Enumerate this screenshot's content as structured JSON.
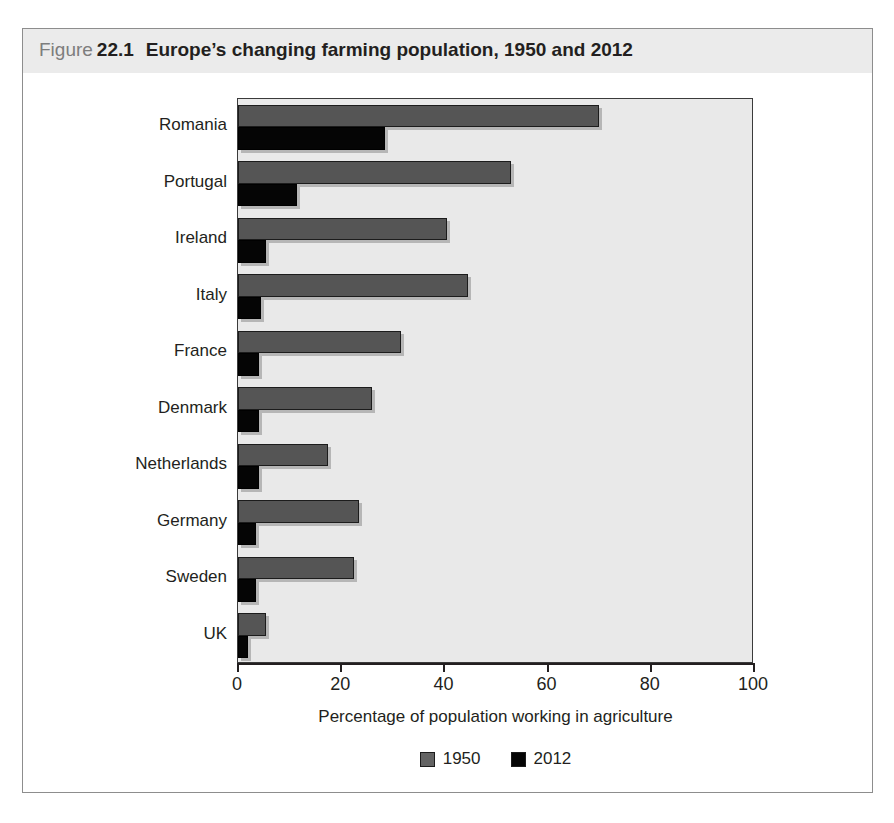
{
  "figure": {
    "label_word": "Figure",
    "number": "22.1",
    "title": "Europe’s changing farming population, 1950 and 2012"
  },
  "chart_data": {
    "type": "bar",
    "orientation": "horizontal",
    "title": "Europe’s changing farming population, 1950 and 2012",
    "xlabel": "Percentage of population working in agriculture",
    "ylabel": "",
    "xlim": [
      0,
      100
    ],
    "xticks": [
      0,
      20,
      40,
      60,
      80,
      100
    ],
    "xtick_labels": [
      "0",
      "20",
      "40",
      "60",
      "80",
      "100"
    ],
    "grid": false,
    "legend_position": "bottom-center",
    "categories": [
      "Romania",
      "Portugal",
      "Ireland",
      "Italy",
      "France",
      "Denmark",
      "Netherlands",
      "Germany",
      "Sweden",
      "UK"
    ],
    "series": [
      {
        "name": "1950",
        "color": "#555555",
        "values": [
          70,
          53,
          40.5,
          44.5,
          31.5,
          26,
          17.5,
          23.5,
          22.5,
          5.5
        ]
      },
      {
        "name": "2012",
        "color": "#050505",
        "values": [
          28.5,
          11.5,
          5.5,
          4.5,
          4,
          4,
          4,
          3.5,
          3.5,
          2
        ]
      }
    ]
  },
  "legend": {
    "items": [
      {
        "label": "1950",
        "swatch": "gray-swatch"
      },
      {
        "label": "2012",
        "swatch": "black-swatch"
      }
    ]
  },
  "colors": {
    "plot_background": "#e9e9e9",
    "title_band": "#ebebeb",
    "series_1950": "#555555",
    "series_2012": "#050505",
    "text": "#231f20",
    "frame": "#8d8d8d"
  }
}
